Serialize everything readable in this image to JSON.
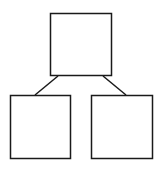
{
  "diagram": {
    "type": "tree",
    "nodes": [
      {
        "id": "root",
        "label": ""
      },
      {
        "id": "left-child",
        "label": ""
      },
      {
        "id": "right-child",
        "label": ""
      }
    ],
    "edges": [
      {
        "from": "root",
        "to": "left-child"
      },
      {
        "from": "root",
        "to": "right-child"
      }
    ],
    "colors": {
      "stroke": "#1a1a1a",
      "fill": "#ffffff",
      "background": "#ffffff"
    }
  }
}
